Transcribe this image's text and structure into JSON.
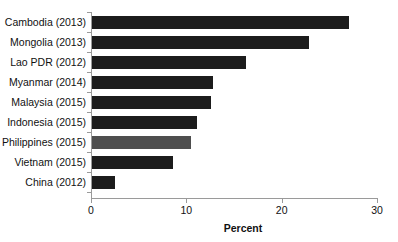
{
  "chart_data": {
    "type": "bar",
    "orientation": "horizontal",
    "title": "",
    "xlabel": "Percent",
    "ylabel": "",
    "xlim": [
      0,
      30
    ],
    "xticks": [
      0,
      10,
      20,
      30
    ],
    "xtick_labels": [
      "0",
      "10",
      "20",
      "30"
    ],
    "grid": false,
    "legend": "none",
    "categories": [
      "Cambodia (2013)",
      "Mongolia (2013)",
      "Lao PDR (2012)",
      "Myanmar (2014)",
      "Malaysia (2015)",
      "Indonesia (2015)",
      "Philippines (2015)",
      "Vietnam (2015)",
      "China (2012)"
    ],
    "values": [
      27.0,
      22.8,
      16.2,
      12.7,
      12.5,
      11.0,
      10.4,
      8.5,
      2.4
    ],
    "bar_colors": [
      "#1c1c1c",
      "#1c1c1c",
      "#1c1c1c",
      "#1c1c1c",
      "#1c1c1c",
      "#1c1c1c",
      "#4e4e4e",
      "#1c1c1c",
      "#1c1c1c"
    ],
    "highlight_category": "Philippines (2015)",
    "bars": [
      {
        "label": "Cambodia (2013)",
        "value": 27.0,
        "color": "#1c1c1c",
        "highlight": false
      },
      {
        "label": "Mongolia (2013)",
        "value": 22.8,
        "color": "#1c1c1c",
        "highlight": false
      },
      {
        "label": "Lao PDR (2012)",
        "value": 16.2,
        "color": "#1c1c1c",
        "highlight": false
      },
      {
        "label": "Myanmar (2014)",
        "value": 12.7,
        "color": "#1c1c1c",
        "highlight": false
      },
      {
        "label": "Malaysia (2015)",
        "value": 12.5,
        "color": "#1c1c1c",
        "highlight": false
      },
      {
        "label": "Indonesia (2015)",
        "value": 11.0,
        "color": "#1c1c1c",
        "highlight": false
      },
      {
        "label": "Philippines (2015)",
        "value": 10.4,
        "color": "#4e4e4e",
        "highlight": true
      },
      {
        "label": "Vietnam (2015)",
        "value": 8.5,
        "color": "#1c1c1c",
        "highlight": false
      },
      {
        "label": "China (2012)",
        "value": 2.4,
        "color": "#1c1c1c",
        "highlight": false
      }
    ]
  },
  "axis": {
    "x_title": "Percent"
  },
  "colors": {
    "bar_default": "#1c1c1c",
    "bar_highlight": "#4e4e4e",
    "axis_line": "#9a9a9a",
    "text": "#111111",
    "background": "#ffffff"
  }
}
